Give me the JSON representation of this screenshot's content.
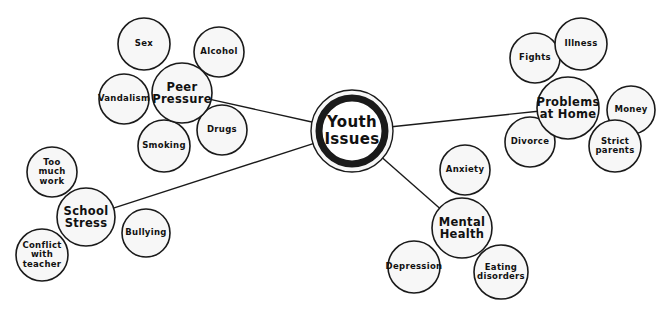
{
  "diagram": {
    "type": "mind-map",
    "title": "Youth Issues",
    "background_color": "#ffffff",
    "node_fill": "#f7f7f7",
    "node_stroke": "#1a1a1a",
    "center": {
      "id": "youth-issues",
      "label": "Youth\nIssues",
      "cx": 352,
      "cy": 131,
      "outer_radius": 41,
      "ring_radius": 33,
      "ring_width": 7
    },
    "branches": [
      {
        "id": "peer-pressure",
        "label": "Peer\nPressure",
        "cx": 182,
        "cy": 93,
        "r": 30,
        "leaves": [
          {
            "id": "sex",
            "label": "Sex",
            "cx": 144,
            "cy": 44,
            "r": 26
          },
          {
            "id": "alcohol",
            "label": "Alcohol",
            "cx": 219,
            "cy": 52,
            "r": 25
          },
          {
            "id": "vandalism",
            "label": "Vandalism",
            "cx": 124,
            "cy": 99,
            "r": 25
          },
          {
            "id": "smoking",
            "label": "Smoking",
            "cx": 164,
            "cy": 146,
            "r": 26
          },
          {
            "id": "drugs",
            "label": "Drugs",
            "cx": 222,
            "cy": 130,
            "r": 25
          }
        ]
      },
      {
        "id": "problems-at-home",
        "label": "Problems\nat Home",
        "cx": 568,
        "cy": 108,
        "r": 31,
        "leaves": [
          {
            "id": "fights",
            "label": "Fights",
            "cx": 535,
            "cy": 58,
            "r": 25
          },
          {
            "id": "illness",
            "label": "Illness",
            "cx": 581,
            "cy": 44,
            "r": 26
          },
          {
            "id": "money",
            "label": "Money",
            "cx": 631,
            "cy": 110,
            "r": 24
          },
          {
            "id": "divorce",
            "label": "Divorce",
            "cx": 530,
            "cy": 142,
            "r": 25
          },
          {
            "id": "strict-parents",
            "label": "Strict\nparents",
            "cx": 615,
            "cy": 146,
            "r": 26
          }
        ]
      },
      {
        "id": "school-stress",
        "label": "School\nStress",
        "cx": 86,
        "cy": 217,
        "r": 29,
        "leaves": [
          {
            "id": "too-much-work",
            "label": "Too\nmuch\nwork",
            "cx": 52,
            "cy": 172,
            "r": 25
          },
          {
            "id": "conflict-with-teacher",
            "label": "Conflict\nwith\nteacher",
            "cx": 42,
            "cy": 255,
            "r": 26
          },
          {
            "id": "bullying",
            "label": "Bullying",
            "cx": 146,
            "cy": 233,
            "r": 24
          }
        ]
      },
      {
        "id": "mental-health",
        "label": "Mental\nHealth",
        "cx": 462,
        "cy": 228,
        "r": 30,
        "leaves": [
          {
            "id": "anxiety",
            "label": "Anxiety",
            "cx": 465,
            "cy": 170,
            "r": 25
          },
          {
            "id": "depression",
            "label": "Depression",
            "cx": 414,
            "cy": 267,
            "r": 26
          },
          {
            "id": "eating-disorders",
            "label": "Eating\ndisorders",
            "cx": 501,
            "cy": 272,
            "r": 27
          }
        ]
      }
    ],
    "connectors": [
      {
        "id": "center-to-peer-pressure",
        "from": "youth-issues",
        "to": "peer-pressure"
      },
      {
        "id": "center-to-problems-at-home",
        "from": "youth-issues",
        "to": "problems-at-home"
      },
      {
        "id": "center-to-school-stress",
        "from": "youth-issues",
        "to": "school-stress"
      },
      {
        "id": "center-to-mental-health",
        "from": "youth-issues",
        "to": "mental-health"
      }
    ]
  }
}
